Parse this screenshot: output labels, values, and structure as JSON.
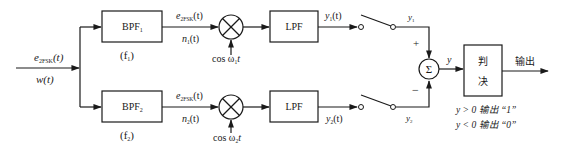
{
  "diagram": {
    "input": {
      "signal_label": "e",
      "signal_sub": "2FSK",
      "signal_arg": "(t)",
      "noise_label": "w(t)"
    },
    "branch1": {
      "bpf_label": "BPF",
      "bpf_sub": "1",
      "bpf_freq": "(f",
      "bpf_freq_sub": "1",
      "bpf_freq_close": ")",
      "signal_label": "e",
      "signal_sub": "2FSK",
      "signal_arg": "(t)",
      "noise_label": "n",
      "noise_sub": "1",
      "noise_arg": "(t)",
      "carrier_label": "cos ω",
      "carrier_sub": "1",
      "carrier_t": "t",
      "lpf_label": "LPF",
      "output_label": "y",
      "output_sub": "1",
      "output_arg": "(t)",
      "sample_label": "y",
      "sample_sub": "1",
      "sign": "+"
    },
    "branch2": {
      "bpf_label": "BPF",
      "bpf_sub": "2",
      "bpf_freq": "(f",
      "bpf_freq_sub": "2",
      "bpf_freq_close": ")",
      "signal_label": "e",
      "signal_sub": "2FSK",
      "signal_arg": "(t)",
      "noise_label": "n",
      "noise_sub": "2",
      "noise_arg": "(t)",
      "carrier_label": "cos ω",
      "carrier_sub": "2",
      "carrier_t": "t",
      "lpf_label": "LPF",
      "output_label": "y",
      "output_sub": "2",
      "output_arg": "(t)",
      "sample_label": "y",
      "sample_sub": "2",
      "sign": "−"
    },
    "summer": {
      "symbol": "Σ",
      "output_label": "y"
    },
    "decision": {
      "line1": "判",
      "line2": "决",
      "output_label": "输出",
      "rule1": "y > 0 输出 “1”",
      "rule2": "y < 0 输出 “0”"
    },
    "colors": {
      "stroke": "#1a1a1a",
      "background": "#ffffff"
    }
  }
}
